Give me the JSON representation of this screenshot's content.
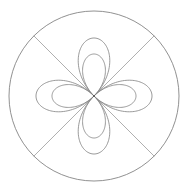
{
  "figure": {
    "background_color": "#ffffff",
    "stroke_color": "#808080",
    "diagonal_color": "#9a9a9a",
    "circle_color": "#7d7d7d",
    "center_dot_color": "#555555",
    "width": 188,
    "height": 192,
    "center_x": 94,
    "center_y": 96
  },
  "chart_data": {
    "type": "line",
    "subtitle": "",
    "coordinate_system": "polar",
    "xlabel": "",
    "ylabel": "",
    "grid": false,
    "legend_position": "none",
    "axis_ranges": {
      "theta": [
        0,
        6.283185307179586
      ],
      "r": [
        0,
        85
      ]
    },
    "center": {
      "x": 94,
      "y": 96
    },
    "series": [
      {
        "name": "bounding-circle",
        "kind": "circle",
        "equation": "r = 85",
        "radius": 85,
        "petal_count": 0,
        "values": [
          85
        ]
      },
      {
        "name": "outer-rose",
        "kind": "rose",
        "equation": "r = 58 * cos(2 * theta)",
        "amplitude": 58,
        "petal_count": 4,
        "petal_angles_deg": [
          0,
          90,
          180,
          270
        ],
        "values": [
          58,
          58,
          58,
          58
        ]
      },
      {
        "name": "inner-rose",
        "kind": "rose",
        "equation": "r = 42 * cos(2 * theta)",
        "amplitude": 42,
        "petal_count": 4,
        "petal_angles_deg": [
          0,
          90,
          180,
          270
        ],
        "values": [
          42,
          42,
          42,
          42
        ]
      },
      {
        "name": "diagonal-chords",
        "kind": "line",
        "count": 2,
        "angles_deg": [
          45,
          135
        ],
        "length": 170,
        "values": [
          45,
          135
        ]
      }
    ],
    "annotations": []
  }
}
